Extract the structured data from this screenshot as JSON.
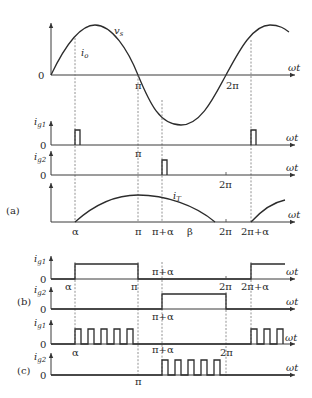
{
  "figure": {
    "panels": [
      "(a)",
      "(b)",
      "(c)"
    ],
    "axis_label_x": "ωt",
    "zero_label": "0",
    "angle_labels": {
      "alpha": "α",
      "pi": "π",
      "pi_plus_alpha": "π+α",
      "beta": "β",
      "two_pi": "2π",
      "two_pi_plus_alpha": "2π+α"
    },
    "signals": {
      "vs": {
        "main": "v",
        "sub": "s"
      },
      "io": {
        "main": "i",
        "sub": "o"
      },
      "ig1": {
        "main": "i",
        "sub": "g1"
      },
      "ig2": {
        "main": "i",
        "sub": "g2"
      },
      "iT": {
        "main": "i",
        "sub": "T"
      }
    },
    "subplots": [
      {
        "panel": "(a)",
        "signal": "v_s, i_o",
        "description": "Supply voltage sine wave with dashed markers at α, π, π+α, 2π+α"
      },
      {
        "panel": "(a)",
        "signal": "i_g1",
        "description": "Short pulse at α and at 2π+α"
      },
      {
        "panel": "(a)",
        "signal": "i_g2",
        "description": "Short pulse at π+α"
      },
      {
        "panel": "(a)",
        "signal": "i_T",
        "description": "Thyristor current from α to β, restarting at 2π+α"
      },
      {
        "panel": "(b)",
        "signal": "i_g1",
        "description": "Continuous gate signal from α to π and from 2π+α"
      },
      {
        "panel": "(b)",
        "signal": "i_g2",
        "description": "Continuous gate signal from π+α to 2π"
      },
      {
        "panel": "(c)",
        "signal": "i_g1",
        "description": "Pulse train from α to π and from 2π+α"
      },
      {
        "panel": "(c)",
        "signal": "i_g2",
        "description": "Pulse train from π+α to 2π"
      }
    ]
  }
}
